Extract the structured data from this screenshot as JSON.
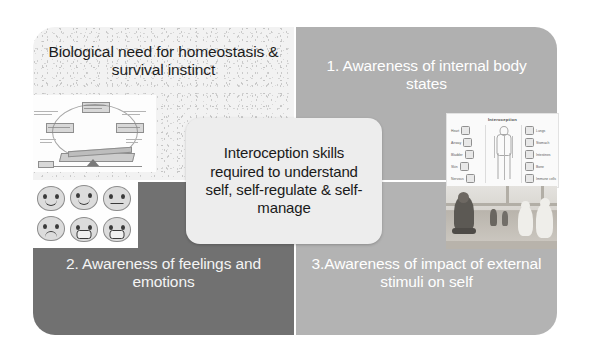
{
  "slide": {
    "background_color": "#ffffff"
  },
  "diagram": {
    "type": "four-quadrant-with-center-callout",
    "center": {
      "text": "Interoception skills required to understand self, self-regulate & self-manage",
      "background_color": "#ededed",
      "text_color": "#1a1a1a"
    },
    "quadrants": [
      {
        "id": "top-left",
        "label": "Biological need for homeostasis & survival instinct",
        "background_color": "#f2f2f2",
        "text_color": "#1c1c1c",
        "image": "homeostasis-cycle-diagram"
      },
      {
        "id": "top-right",
        "label": "1. Awareness of internal body states",
        "background_color": "#b0b0b0",
        "text_color": "#ffffff",
        "image": "interoception-body-infographic"
      },
      {
        "id": "bottom-left",
        "label": "2. Awareness of feelings and emotions",
        "background_color": "#717171",
        "text_color": "#f4f4f4",
        "image": "emotion-faces-grid"
      },
      {
        "id": "bottom-right",
        "label": "3.Awareness of impact of external stimuli on self",
        "background_color": "#b3b3b3",
        "text_color": "#ffffff",
        "image": "children-in-hall-photo"
      }
    ]
  },
  "interoception_infographic": {
    "title": "Interoception",
    "left_items": [
      "Heart",
      "Airway",
      "Bladder",
      "Skin",
      "Nervous"
    ],
    "right_items": [
      "Lungs",
      "Stomach",
      "Intestines",
      "Bone",
      "Immune cells"
    ]
  }
}
